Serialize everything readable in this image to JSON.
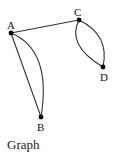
{
  "diagram": {
    "type": "graph",
    "caption": "Graph",
    "nodes": [
      {
        "id": "A",
        "label": "A"
      },
      {
        "id": "B",
        "label": "B"
      },
      {
        "id": "C",
        "label": "C"
      },
      {
        "id": "D",
        "label": "D"
      }
    ],
    "edges": [
      {
        "from": "A",
        "to": "C",
        "style": "straight"
      },
      {
        "from": "A",
        "to": "B",
        "style": "straight"
      },
      {
        "from": "A",
        "to": "B",
        "style": "curved"
      },
      {
        "from": "C",
        "to": "D",
        "style": "curved-left"
      },
      {
        "from": "C",
        "to": "D",
        "style": "curved-right"
      }
    ]
  }
}
